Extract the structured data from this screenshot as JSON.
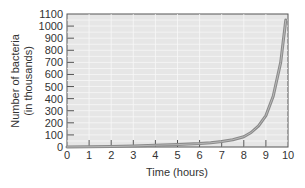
{
  "chart_data": {
    "type": "line",
    "title": "",
    "xlabel": "Time (hours)",
    "ylabel": [
      "Number of bacteria",
      "(in thousands)"
    ],
    "xlim": [
      0,
      10
    ],
    "ylim": [
      0,
      1100
    ],
    "xticks": [
      0,
      1,
      2,
      3,
      4,
      5,
      6,
      7,
      8,
      9,
      10
    ],
    "yticks": [
      0,
      100,
      200,
      300,
      400,
      500,
      600,
      700,
      800,
      900,
      1000,
      1100
    ],
    "grid": true,
    "series": [
      {
        "name": "Bacterial growth",
        "x": [
          0,
          1,
          2,
          3,
          4,
          5,
          6,
          6.5,
          7,
          7.5,
          8,
          8.33,
          8.67,
          9,
          9.33,
          9.67,
          9.9
        ],
        "y": [
          1,
          2,
          4,
          8,
          15,
          20,
          28,
          35,
          45,
          60,
          85,
          120,
          175,
          260,
          420,
          700,
          1050
        ]
      }
    ]
  },
  "colors": {
    "plot_background": "#e6e6e6",
    "grid": "#f7f7f7",
    "curve": "#8a8a8a",
    "axis": "#555555"
  }
}
